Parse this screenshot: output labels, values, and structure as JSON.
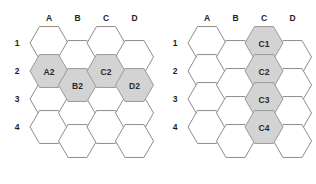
{
  "figure": {
    "title": "",
    "panel_count": 2,
    "hex_orientation": "flat-top",
    "colors": {
      "highlight_fill": "#d3d3d3",
      "highlight_stroke": "#9a9a9a",
      "plain_fill": "#ffffff",
      "plain_stroke": "#8d8d8d",
      "label_text": "#2a2a2a",
      "axis_text": "#1d1d1d",
      "background": "#ffffff"
    }
  },
  "panels": [
    {
      "id": "left",
      "name": "hex-grid-left",
      "column_headers": [
        "A",
        "B",
        "C",
        "D"
      ],
      "row_headers": [
        "1",
        "2",
        "3",
        "4"
      ],
      "cells": [
        {
          "col": "A",
          "row": "1",
          "label": "",
          "highlight": false
        },
        {
          "col": "A",
          "row": "2",
          "label": "A2",
          "highlight": true
        },
        {
          "col": "A",
          "row": "3",
          "label": "",
          "highlight": false
        },
        {
          "col": "A",
          "row": "4",
          "label": "",
          "highlight": false
        },
        {
          "col": "B",
          "row": "1",
          "label": "",
          "highlight": false
        },
        {
          "col": "B",
          "row": "2",
          "label": "B2",
          "highlight": true
        },
        {
          "col": "B",
          "row": "3",
          "label": "",
          "highlight": false
        },
        {
          "col": "B",
          "row": "4",
          "label": "",
          "highlight": false
        },
        {
          "col": "C",
          "row": "1",
          "label": "",
          "highlight": false
        },
        {
          "col": "C",
          "row": "2",
          "label": "C2",
          "highlight": true
        },
        {
          "col": "C",
          "row": "3",
          "label": "",
          "highlight": false
        },
        {
          "col": "C",
          "row": "4",
          "label": "",
          "highlight": false
        },
        {
          "col": "D",
          "row": "1",
          "label": "",
          "highlight": false
        },
        {
          "col": "D",
          "row": "2",
          "label": "D2",
          "highlight": true
        },
        {
          "col": "D",
          "row": "3",
          "label": "",
          "highlight": false
        },
        {
          "col": "D",
          "row": "4",
          "label": "",
          "highlight": false
        }
      ],
      "highlighted_labels": [
        "A2",
        "B2",
        "C2",
        "D2"
      ]
    },
    {
      "id": "right",
      "name": "hex-grid-right",
      "column_headers": [
        "A",
        "B",
        "C",
        "D"
      ],
      "row_headers": [
        "1",
        "2",
        "3",
        "4"
      ],
      "cells": [
        {
          "col": "A",
          "row": "1",
          "label": "",
          "highlight": false
        },
        {
          "col": "A",
          "row": "2",
          "label": "",
          "highlight": false
        },
        {
          "col": "A",
          "row": "3",
          "label": "",
          "highlight": false
        },
        {
          "col": "A",
          "row": "4",
          "label": "",
          "highlight": false
        },
        {
          "col": "B",
          "row": "1",
          "label": "",
          "highlight": false
        },
        {
          "col": "B",
          "row": "2",
          "label": "",
          "highlight": false
        },
        {
          "col": "B",
          "row": "3",
          "label": "",
          "highlight": false
        },
        {
          "col": "B",
          "row": "4",
          "label": "",
          "highlight": false
        },
        {
          "col": "C",
          "row": "1",
          "label": "C1",
          "highlight": true
        },
        {
          "col": "C",
          "row": "2",
          "label": "C2",
          "highlight": true
        },
        {
          "col": "C",
          "row": "3",
          "label": "C3",
          "highlight": true
        },
        {
          "col": "C",
          "row": "4",
          "label": "C4",
          "highlight": true
        },
        {
          "col": "D",
          "row": "1",
          "label": "",
          "highlight": false
        },
        {
          "col": "D",
          "row": "2",
          "label": "",
          "highlight": false
        },
        {
          "col": "D",
          "row": "3",
          "label": "",
          "highlight": false
        },
        {
          "col": "D",
          "row": "4",
          "label": "",
          "highlight": false
        }
      ],
      "highlighted_labels": [
        "C1",
        "C2",
        "C3",
        "C4"
      ]
    }
  ],
  "geometry": {
    "hex_radius": 19,
    "col_pitch": 28.5,
    "row_pitch": 28,
    "origin_x": 49,
    "origin_y": 43,
    "odd_col_offset_y": 14,
    "header_y": 18,
    "row_label_x": 17
  }
}
